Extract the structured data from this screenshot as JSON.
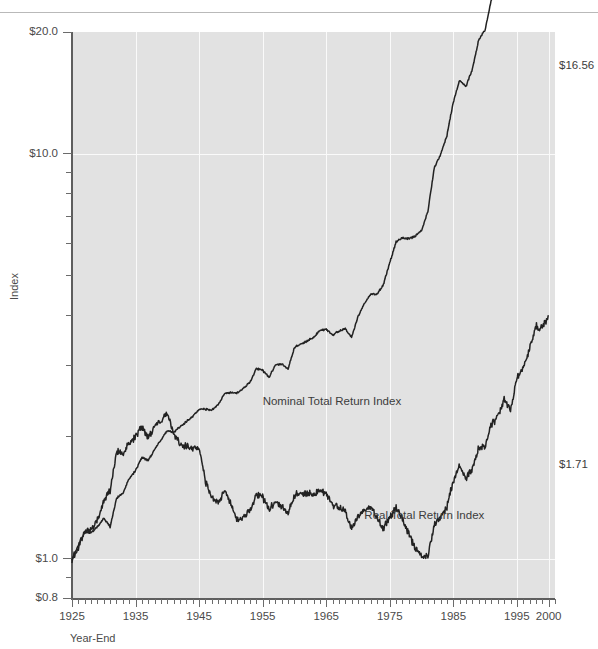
{
  "page": {
    "header_ghost_text": "",
    "figure_background": "#ffffff",
    "plot_background": "#e2e2e2",
    "gridline_color": "#fafafa",
    "line_color": "#222222",
    "text_color": "#4a4a4a"
  },
  "axis": {
    "y_title": "Index",
    "x_title": "Year-End",
    "y_labels": [
      "$20.0",
      "$10.0",
      "$1.0",
      "$0.8"
    ],
    "x_labels": [
      "1925",
      "1935",
      "1945",
      "1955",
      "1965",
      "1975",
      "1985",
      "1995",
      "2000"
    ]
  },
  "annotations": {
    "nominal_label": "Nominal Total Return Index",
    "real_label": "Real Total Return Index",
    "nominal_end_value": "$16.56",
    "real_end_value": "$1.71"
  },
  "chart_data": {
    "type": "line",
    "title": "",
    "subtitle": "",
    "xlabel": "Year-End",
    "ylabel": "Index",
    "yscale": "log",
    "ylim": [
      0.8,
      20.0
    ],
    "xlim": [
      1925,
      2001
    ],
    "y_ticks_major": [
      0.8,
      1.0,
      10.0,
      20.0
    ],
    "y_tick_labels": [
      "$0.8",
      "$1.0",
      "$10.0",
      "$20.0"
    ],
    "x_ticks_major": [
      1925,
      1935,
      1945,
      1955,
      1965,
      1975,
      1985,
      1995,
      2000
    ],
    "x_ticks_minor_step": 1,
    "grid": "vertical-and-horizontal-white",
    "legend": "inline-annotations",
    "series": [
      {
        "name": "Nominal Total Return Index",
        "end_label": "$16.56",
        "label_position": {
          "x": 1955,
          "y": 2.45
        },
        "x": [
          1925,
          1926,
          1927,
          1928,
          1929,
          1930,
          1931,
          1932,
          1933,
          1934,
          1935,
          1936,
          1937,
          1938,
          1939,
          1940,
          1941,
          1942,
          1943,
          1944,
          1945,
          1946,
          1947,
          1948,
          1949,
          1950,
          1951,
          1952,
          1953,
          1954,
          1955,
          1956,
          1957,
          1958,
          1959,
          1960,
          1961,
          1962,
          1963,
          1964,
          1965,
          1966,
          1967,
          1968,
          1969,
          1970,
          1971,
          1972,
          1973,
          1974,
          1975,
          1976,
          1977,
          1978,
          1979,
          1980,
          1981,
          1982,
          1983,
          1984,
          1985,
          1986,
          1987,
          1988,
          1989,
          1990,
          1991,
          1992,
          1993,
          1994,
          1995,
          1996,
          1997,
          1998,
          1999,
          2000,
          2001
        ],
        "values": [
          1.0,
          1.08,
          1.16,
          1.16,
          1.2,
          1.26,
          1.2,
          1.41,
          1.45,
          1.58,
          1.65,
          1.78,
          1.75,
          1.86,
          1.97,
          2.07,
          2.05,
          2.12,
          2.18,
          2.25,
          2.34,
          2.34,
          2.33,
          2.4,
          2.56,
          2.57,
          2.57,
          2.64,
          2.73,
          2.95,
          2.92,
          2.81,
          3.01,
          3.03,
          2.94,
          3.33,
          3.39,
          3.45,
          3.52,
          3.66,
          3.69,
          3.57,
          3.65,
          3.7,
          3.52,
          3.96,
          4.27,
          4.51,
          4.5,
          4.76,
          5.38,
          6.07,
          6.2,
          6.17,
          6.26,
          6.46,
          7.22,
          9.23,
          9.95,
          11.1,
          13.45,
          15.2,
          14.68,
          16.17,
          19.14,
          20.24,
          24.02,
          25.91,
          29.34,
          28.35,
          35.13,
          38.37,
          43.84,
          50.77,
          51.34,
          57.09,
          16.56
        ],
        "note": "Monthly series drawn as smooth curve; endpoint value labelled $16.56 on chart"
      },
      {
        "name": "Real Total Return Index",
        "end_label": "$1.71",
        "label_position": {
          "x": 1971,
          "y": 1.28
        },
        "x": [
          1925,
          1926,
          1927,
          1928,
          1929,
          1930,
          1931,
          1932,
          1933,
          1934,
          1935,
          1936,
          1937,
          1938,
          1939,
          1940,
          1941,
          1942,
          1943,
          1944,
          1945,
          1946,
          1947,
          1948,
          1949,
          1950,
          1951,
          1952,
          1953,
          1954,
          1955,
          1956,
          1957,
          1958,
          1959,
          1960,
          1961,
          1962,
          1963,
          1964,
          1965,
          1966,
          1967,
          1968,
          1969,
          1970,
          1971,
          1972,
          1973,
          1974,
          1975,
          1976,
          1977,
          1978,
          1979,
          1980,
          1981,
          1982,
          1983,
          1984,
          1985,
          1986,
          1987,
          1988,
          1989,
          1990,
          1991,
          1992,
          1993,
          1994,
          1995,
          1996,
          1997,
          1998,
          1999,
          2000,
          2001
        ],
        "values": [
          1.0,
          1.06,
          1.17,
          1.18,
          1.25,
          1.39,
          1.48,
          1.84,
          1.81,
          1.94,
          2.0,
          2.12,
          1.99,
          2.12,
          2.2,
          2.28,
          2.03,
          1.92,
          1.89,
          1.88,
          1.88,
          1.55,
          1.42,
          1.37,
          1.48,
          1.36,
          1.25,
          1.27,
          1.32,
          1.44,
          1.42,
          1.33,
          1.38,
          1.35,
          1.29,
          1.44,
          1.45,
          1.45,
          1.44,
          1.47,
          1.45,
          1.36,
          1.34,
          1.31,
          1.18,
          1.27,
          1.32,
          1.35,
          1.26,
          1.19,
          1.26,
          1.34,
          1.25,
          1.15,
          1.06,
          1.01,
          1.02,
          1.21,
          1.26,
          1.34,
          1.56,
          1.7,
          1.58,
          1.66,
          1.88,
          1.89,
          2.14,
          2.24,
          2.47,
          2.32,
          2.79,
          2.96,
          3.3,
          3.75,
          3.71,
          4.0,
          1.71
        ],
        "note": "Monthly series drawn as smooth curve; endpoint value labelled $1.71 on chart"
      }
    ]
  }
}
